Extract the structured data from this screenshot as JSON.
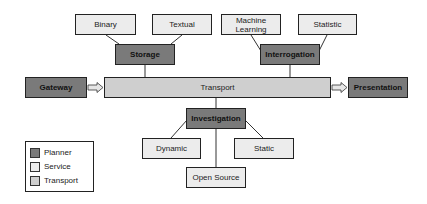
{
  "diagram": {
    "nodes": {
      "binary": {
        "label": "Binary",
        "type": "service"
      },
      "textual": {
        "label": "Textual",
        "type": "service"
      },
      "storage": {
        "label": "Storage",
        "type": "planner"
      },
      "machine_learning": {
        "label": "Machine Learning",
        "type": "service"
      },
      "statistic": {
        "label": "Statistic",
        "type": "service"
      },
      "interrogation": {
        "label": "Interrogation",
        "type": "planner"
      },
      "gateway": {
        "label": "Gateway",
        "type": "planner"
      },
      "transport": {
        "label": "Transport",
        "type": "transport"
      },
      "presentation": {
        "label": "Presentation",
        "type": "planner"
      },
      "investigation": {
        "label": "Investigation",
        "type": "planner"
      },
      "dynamic": {
        "label": "Dynamic",
        "type": "service"
      },
      "static": {
        "label": "Static",
        "type": "service"
      },
      "open_source": {
        "label": "Open Source",
        "type": "service"
      }
    },
    "edges": [
      {
        "from": "binary",
        "to": "storage",
        "style": "line"
      },
      {
        "from": "textual",
        "to": "storage",
        "style": "line"
      },
      {
        "from": "storage",
        "to": "transport",
        "style": "line"
      },
      {
        "from": "machine_learning",
        "to": "interrogation",
        "style": "line"
      },
      {
        "from": "statistic",
        "to": "interrogation",
        "style": "line"
      },
      {
        "from": "interrogation",
        "to": "transport",
        "style": "line"
      },
      {
        "from": "gateway",
        "to": "transport",
        "style": "block-arrow"
      },
      {
        "from": "transport",
        "to": "presentation",
        "style": "block-arrow"
      },
      {
        "from": "transport",
        "to": "investigation",
        "style": "line"
      },
      {
        "from": "investigation",
        "to": "dynamic",
        "style": "line"
      },
      {
        "from": "investigation",
        "to": "static",
        "style": "line"
      },
      {
        "from": "investigation",
        "to": "open_source",
        "style": "line"
      }
    ]
  },
  "legend": {
    "items": [
      {
        "label": "Planner",
        "color": "#7a7a7a"
      },
      {
        "label": "Service",
        "color": "#ececec"
      },
      {
        "label": "Transport",
        "color": "#cfcfcf"
      }
    ]
  },
  "colors": {
    "planner": "#7a7a7a",
    "service": "#ececec",
    "transport": "#cfcfcf",
    "border": "#222222"
  }
}
